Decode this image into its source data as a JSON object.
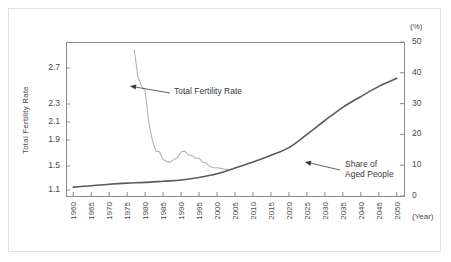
{
  "figure": {
    "left_axis_title": "Total Fertility Rate",
    "right_axis_unit": "(%)",
    "x_axis_unit": "(Year)"
  },
  "annotations": {
    "tfr": {
      "line1": "Total Fertility Rate"
    },
    "aged": {
      "line1": "Share of",
      "line2": "Aged People"
    }
  },
  "colors": {
    "tfr_line": "#b4b4b4",
    "aged_line": "#5a5a5a",
    "axis": "#8c8c8c",
    "frame": "#e2e2e2",
    "text": "#3a3a3a"
  },
  "chart_data": {
    "type": "line",
    "title": "",
    "xlabel": "(Year)",
    "ylabel": "Total Fertility Rate",
    "y2label": "(%)",
    "grid": false,
    "legend": "annotations",
    "x": [
      1960,
      1965,
      1970,
      1975,
      1980,
      1985,
      1990,
      1995,
      2000,
      2005,
      2010,
      2015,
      2020,
      2025,
      2030,
      2035,
      2040,
      2045,
      2050
    ],
    "xlim": [
      1958,
      2052
    ],
    "xticks": [
      "1960",
      "1965",
      "1970",
      "1975",
      "1980",
      "1985",
      "1990",
      "1995",
      "2000",
      "2005",
      "2010",
      "2015",
      "2020",
      "2025",
      "2030",
      "2035",
      "2040",
      "2045",
      "2050"
    ],
    "yticks_left": [
      "2.7",
      "2.3",
      "2.1",
      "1.9",
      "1.5",
      "1.1"
    ],
    "ylim_left": [
      1.1,
      2.9
    ],
    "yticks_right": [
      "50",
      "40",
      "30",
      "20",
      "10",
      "0"
    ],
    "ylim_right": [
      0,
      50
    ],
    "series": [
      {
        "name": "Total Fertility Rate",
        "axis": "left",
        "color": "#b4b4b4",
        "x": [
          1977,
          1978,
          1979,
          1980,
          1981,
          1982,
          1983,
          1984,
          1985,
          1986,
          1987,
          1988,
          1989,
          1990,
          1991,
          1992,
          1993,
          1994,
          1995,
          1996,
          1997,
          1998,
          1999,
          2000,
          2001,
          2002,
          2003
        ],
        "values": [
          2.9,
          2.6,
          2.5,
          2.45,
          2.1,
          1.9,
          1.73,
          1.72,
          1.6,
          1.57,
          1.56,
          1.6,
          1.63,
          1.72,
          1.73,
          1.67,
          1.66,
          1.62,
          1.62,
          1.56,
          1.55,
          1.49,
          1.47,
          1.47,
          1.46,
          1.45,
          1.44
        ]
      },
      {
        "name": "Share of Aged People",
        "axis": "right",
        "color": "#5a5a5a",
        "x": [
          1960,
          1965,
          1970,
          1975,
          1980,
          1985,
          1990,
          1995,
          2000,
          2005,
          2010,
          2015,
          2020,
          2025,
          2030,
          2035,
          2040,
          2045,
          2050
        ],
        "values": [
          2.9,
          3.3,
          3.8,
          4.2,
          4.4,
          4.8,
          5.2,
          6.0,
          7.2,
          9.1,
          11.0,
          13.2,
          15.7,
          20.0,
          24.5,
          28.8,
          32.3,
          35.6,
          38.2
        ]
      }
    ]
  }
}
